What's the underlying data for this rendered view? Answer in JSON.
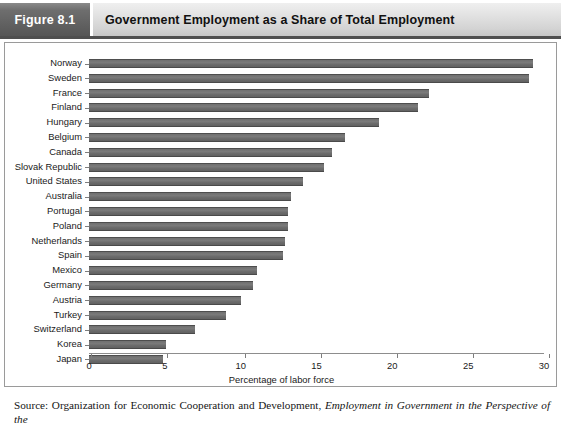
{
  "header": {
    "figure_tag": "Figure 8.1",
    "title": "Government Employment as a Share of Total Employment"
  },
  "source": {
    "prefix": "Source: Organization for Economic Cooperation and Development,",
    "italic_title": "Employment in Government in the Perspective of the"
  },
  "chart_data": {
    "type": "bar",
    "orientation": "horizontal",
    "title": "Government Employment as a Share of Total Employment",
    "xlabel": "Percentage of labor force",
    "ylabel": "",
    "xlim": [
      0,
      30
    ],
    "xticks": [
      0,
      5,
      10,
      15,
      20,
      25,
      30
    ],
    "grid": false,
    "legend": null,
    "categories": [
      "Norway",
      "Sweden",
      "France",
      "Finland",
      "Hungary",
      "Belgium",
      "Canada",
      "Slovak Republic",
      "United States",
      "Australia",
      "Portugal",
      "Poland",
      "Netherlands",
      "Spain",
      "Mexico",
      "Germany",
      "Austria",
      "Turkey",
      "Switzerland",
      "Korea",
      "Japan"
    ],
    "values": [
      29.3,
      29.0,
      22.4,
      21.7,
      19.1,
      16.9,
      16.0,
      15.5,
      14.1,
      13.3,
      13.1,
      13.1,
      12.9,
      12.8,
      11.1,
      10.8,
      10.0,
      9.0,
      7.0,
      5.1,
      4.9
    ],
    "bar_color": "#6b6b6b"
  }
}
